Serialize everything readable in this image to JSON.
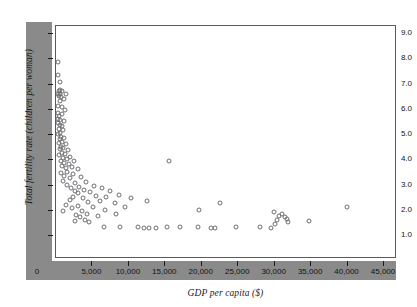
{
  "chart_data": {
    "type": "scatter",
    "title": "",
    "xlabel": "GDP per capita ($)",
    "ylabel": "Total fertility rate (children per woman)",
    "xlim": [
      0,
      46500
    ],
    "ylim": [
      0,
      9.6
    ],
    "grid": false,
    "legend": null,
    "marker": "open-circle",
    "xticks": [
      {
        "value": 0,
        "label": "0"
      },
      {
        "value": 5000,
        "label": "5,000"
      },
      {
        "value": 10000,
        "label": "10,000"
      },
      {
        "value": 15000,
        "label": "15,000"
      },
      {
        "value": 20000,
        "label": "20,000"
      },
      {
        "value": 25000,
        "label": "25,000"
      },
      {
        "value": 30000,
        "label": "30,000"
      },
      {
        "value": 35000,
        "label": "35,000"
      },
      {
        "value": 40000,
        "label": "40,000"
      },
      {
        "value": 45000,
        "label": "45,000"
      }
    ],
    "yticks": [
      {
        "value": 0,
        "label": "0"
      },
      {
        "value": 1.0,
        "label": "1.0"
      },
      {
        "value": 2.0,
        "label": "2.0"
      },
      {
        "value": 3.0,
        "label": "3.0"
      },
      {
        "value": 4.0,
        "label": "4.0"
      },
      {
        "value": 5.0,
        "label": "5.0"
      },
      {
        "value": 6.0,
        "label": "6.0"
      },
      {
        "value": 7.0,
        "label": "7.0"
      },
      {
        "value": 8.0,
        "label": "8.0"
      },
      {
        "value": 9.0,
        "label": "9.0"
      }
    ],
    "points": [
      [
        480,
        7.85
      ],
      [
        430,
        7.35
      ],
      [
        700,
        7.05
      ],
      [
        620,
        6.75
      ],
      [
        560,
        6.7
      ],
      [
        900,
        6.7
      ],
      [
        430,
        6.6
      ],
      [
        700,
        6.6
      ],
      [
        1500,
        6.6
      ],
      [
        520,
        6.5
      ],
      [
        820,
        6.45
      ],
      [
        1180,
        6.4
      ],
      [
        620,
        6.3
      ],
      [
        400,
        6.1
      ],
      [
        900,
        6.05
      ],
      [
        1350,
        5.95
      ],
      [
        420,
        5.85
      ],
      [
        1000,
        5.8
      ],
      [
        560,
        5.7
      ],
      [
        480,
        5.6
      ],
      [
        700,
        5.55
      ],
      [
        1250,
        5.5
      ],
      [
        430,
        5.45
      ],
      [
        620,
        5.35
      ],
      [
        950,
        5.3
      ],
      [
        520,
        5.2
      ],
      [
        1100,
        5.15
      ],
      [
        700,
        5.05
      ],
      [
        440,
        5.0
      ],
      [
        880,
        4.9
      ],
      [
        1300,
        4.85
      ],
      [
        620,
        4.8
      ],
      [
        1000,
        4.7
      ],
      [
        500,
        4.65
      ],
      [
        1500,
        4.6
      ],
      [
        780,
        4.5
      ],
      [
        1150,
        4.45
      ],
      [
        650,
        4.4
      ],
      [
        1750,
        4.35
      ],
      [
        900,
        4.25
      ],
      [
        1350,
        4.2
      ],
      [
        560,
        4.15
      ],
      [
        2100,
        4.1
      ],
      [
        1050,
        4.05
      ],
      [
        1600,
        4.0
      ],
      [
        760,
        3.95
      ],
      [
        2600,
        3.95
      ],
      [
        1250,
        3.85
      ],
      [
        15600,
        3.95
      ],
      [
        1900,
        3.8
      ],
      [
        980,
        3.75
      ],
      [
        2300,
        3.7
      ],
      [
        1450,
        3.65
      ],
      [
        3100,
        3.6
      ],
      [
        1700,
        3.5
      ],
      [
        860,
        3.45
      ],
      [
        2500,
        3.4
      ],
      [
        1300,
        3.35
      ],
      [
        3600,
        3.3
      ],
      [
        2000,
        3.25
      ],
      [
        1100,
        3.15
      ],
      [
        4300,
        3.1
      ],
      [
        2800,
        3.05
      ],
      [
        1600,
        3.0
      ],
      [
        5400,
        2.95
      ],
      [
        3300,
        2.9
      ],
      [
        2200,
        2.85
      ],
      [
        6400,
        2.85
      ],
      [
        4000,
        2.8
      ],
      [
        2700,
        2.75
      ],
      [
        7600,
        2.75
      ],
      [
        4800,
        2.7
      ],
      [
        3200,
        2.65
      ],
      [
        8800,
        2.6
      ],
      [
        5600,
        2.55
      ],
      [
        2500,
        2.5
      ],
      [
        7000,
        2.5
      ],
      [
        3900,
        2.45
      ],
      [
        10400,
        2.45
      ],
      [
        2000,
        2.4
      ],
      [
        6200,
        2.35
      ],
      [
        12600,
        2.35
      ],
      [
        4500,
        2.3
      ],
      [
        8200,
        2.25
      ],
      [
        1500,
        2.2
      ],
      [
        3100,
        2.15
      ],
      [
        22600,
        2.25
      ],
      [
        5200,
        2.1
      ],
      [
        9600,
        2.1
      ],
      [
        2400,
        2.05
      ],
      [
        40100,
        2.1
      ],
      [
        6800,
        2.0
      ],
      [
        3700,
        1.95
      ],
      [
        19800,
        2.0
      ],
      [
        1100,
        1.95
      ],
      [
        4400,
        1.85
      ],
      [
        8400,
        1.85
      ],
      [
        2900,
        1.8
      ],
      [
        30100,
        1.9
      ],
      [
        31200,
        1.85
      ],
      [
        5900,
        1.75
      ],
      [
        30800,
        1.75
      ],
      [
        31500,
        1.7
      ],
      [
        3400,
        1.7
      ],
      [
        31800,
        1.65
      ],
      [
        4100,
        1.6
      ],
      [
        30400,
        1.6
      ],
      [
        34900,
        1.55
      ],
      [
        2700,
        1.55
      ],
      [
        4700,
        1.5
      ],
      [
        32000,
        1.5
      ],
      [
        30200,
        1.45
      ],
      [
        6700,
        1.3
      ],
      [
        8900,
        1.3
      ],
      [
        11400,
        1.3
      ],
      [
        12200,
        1.28
      ],
      [
        12900,
        1.28
      ],
      [
        13800,
        1.27
      ],
      [
        15400,
        1.3
      ],
      [
        17100,
        1.32
      ],
      [
        19600,
        1.3
      ],
      [
        21400,
        1.28
      ],
      [
        21900,
        1.27
      ],
      [
        24900,
        1.3
      ],
      [
        28100,
        1.3
      ],
      [
        29700,
        1.28
      ]
    ]
  }
}
